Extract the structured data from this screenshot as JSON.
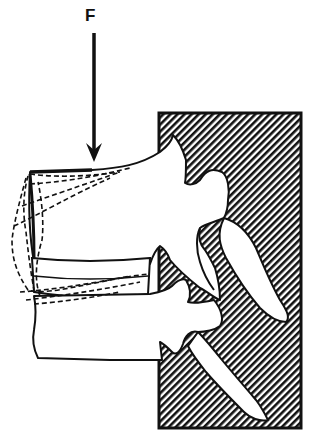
{
  "figure": {
    "type": "biomechanics-diagram",
    "force_label": "F",
    "colors": {
      "ink": "#111111",
      "background": "#ffffff",
      "hatch": "#111111"
    },
    "elements": {
      "force_arrow": {
        "direction": "down",
        "label": "F"
      },
      "fixed_support": {
        "pattern": "diagonal-hatch",
        "position": "right"
      },
      "upper_vertebra": {
        "outline": "solid"
      },
      "lower_vertebra": {
        "outline": "solid"
      },
      "flexed_positions": {
        "outline": "dashed",
        "count": 3
      }
    }
  }
}
